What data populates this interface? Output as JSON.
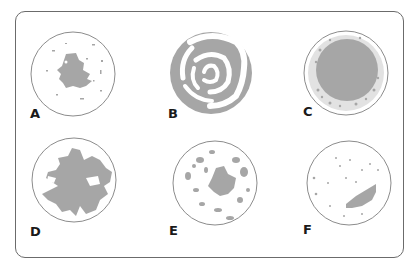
{
  "figure": {
    "colors": {
      "fill": "#a6a6a6",
      "outline": "#8c8c8c",
      "frame": "#6b6b6b",
      "label": "#1a1a1a"
    },
    "panels": [
      {
        "label": "A",
        "pattern": "central irregular blotch with scattered specks"
      },
      {
        "label": "B",
        "pattern": "concentric rings / swirl"
      },
      {
        "label": "C",
        "pattern": "dense central mass with speckled border"
      },
      {
        "label": "D",
        "pattern": "large branching irregular mass"
      },
      {
        "label": "E",
        "pattern": "multiple scattered patches"
      },
      {
        "label": "F",
        "pattern": "single elongated lesion with scattered dots"
      }
    ]
  }
}
